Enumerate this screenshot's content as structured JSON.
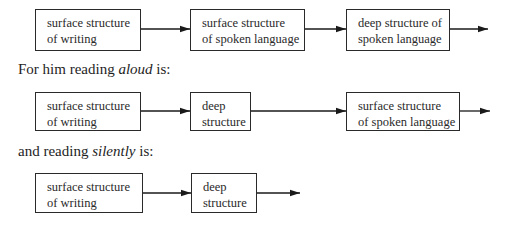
{
  "diagram": {
    "row1": {
      "boxes": [
        {
          "line1": "surface structure",
          "line2": "of writing"
        },
        {
          "line1": "surface structure",
          "line2": "of spoken language"
        },
        {
          "line1": "deep structure of",
          "line2": "spoken language"
        }
      ]
    },
    "caption_aloud": {
      "prefix": "For him reading ",
      "emphasis": "aloud",
      "suffix": " is:"
    },
    "row2": {
      "boxes": [
        {
          "line1": "surface structure",
          "line2": "of writing"
        },
        {
          "line1": "deep",
          "line2": "structure"
        },
        {
          "line1": "surface structure",
          "line2": "of spoken language"
        }
      ]
    },
    "caption_silently": {
      "prefix": "and reading ",
      "emphasis": "silently",
      "suffix": " is:"
    },
    "row3": {
      "boxes": [
        {
          "line1": "surface structure",
          "line2": "of writing"
        },
        {
          "line1": "deep",
          "line2": "structure"
        }
      ]
    }
  }
}
